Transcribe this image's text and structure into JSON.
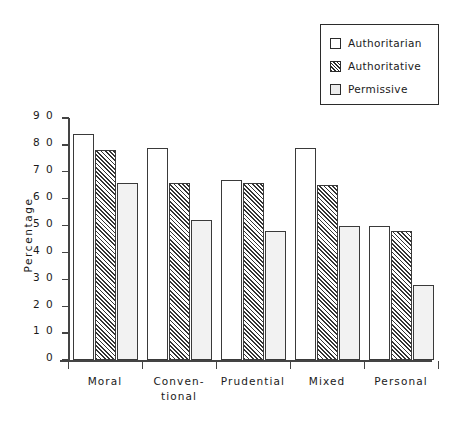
{
  "chart_data": {
    "type": "bar",
    "title": "",
    "xlabel": "",
    "ylabel": "Percentage",
    "ylim": [
      0,
      90
    ],
    "yticks": [
      0,
      10,
      20,
      30,
      40,
      50,
      60,
      70,
      80,
      90
    ],
    "ytick_labels": [
      "0",
      "1 0",
      "2 0",
      "3 0",
      "4 0",
      "5 0",
      "6 0",
      "7 0",
      "8 0",
      "9 0"
    ],
    "grid": false,
    "legend_position": "top-right",
    "categories": [
      "Moral",
      "Conven-\ntional",
      "Prudential",
      "Mixed",
      "Personal"
    ],
    "series": [
      {
        "name": "Authoritarian",
        "fill": "white",
        "values": [
          84,
          79,
          67,
          79,
          50
        ]
      },
      {
        "name": "Authoritative",
        "fill": "hatch",
        "values": [
          78,
          66,
          66,
          65,
          48
        ]
      },
      {
        "name": "Permissive",
        "fill": "light",
        "values": [
          66,
          52,
          48,
          50,
          28
        ]
      }
    ]
  },
  "legend": {
    "items": [
      {
        "label": "Authoritarian",
        "swatch": "white-square-icon"
      },
      {
        "label": "Authoritative",
        "swatch": "hatched-square-icon"
      },
      {
        "label": "Permissive",
        "swatch": "light-square-icon"
      }
    ]
  },
  "colors": {
    "axis": "#444444",
    "bar_border": "#3a3a3a",
    "hatch": "#343434",
    "permissive_fill": "#f2f2f2",
    "background": "#ffffff"
  }
}
